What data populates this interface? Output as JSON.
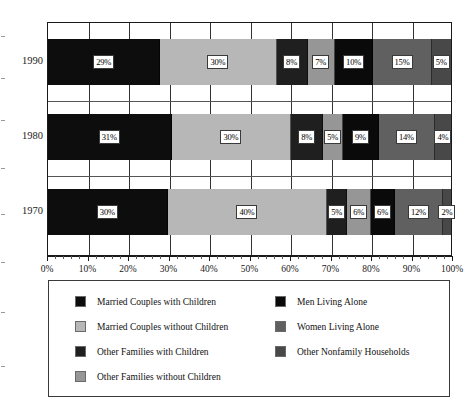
{
  "chart_data": {
    "type": "bar",
    "subtype": "stacked-horizontal-100pct",
    "title": "",
    "xlabel": "",
    "ylabel": "",
    "categories": [
      "1990",
      "1980",
      "1970"
    ],
    "xlim": [
      0,
      100
    ],
    "x_tick_labels": [
      "0%",
      "10%",
      "20%",
      "30%",
      "40%",
      "50%",
      "60%",
      "70%",
      "80%",
      "90%",
      "100%"
    ],
    "x_tick_values": [
      0,
      10,
      20,
      30,
      40,
      50,
      60,
      70,
      80,
      90,
      100
    ],
    "x_minor_tick_step": 2,
    "grid": true,
    "legend_position": "bottom",
    "series": [
      {
        "name": "Married Couples with Children",
        "color": "#0d0d0d",
        "values": [
          29,
          31,
          30
        ],
        "labels": [
          "29%",
          "31%",
          "30%"
        ]
      },
      {
        "name": "Married Couples without Children",
        "color": "#b7b7b7",
        "values": [
          30,
          30,
          40
        ],
        "labels": [
          "30%",
          "30%",
          "40%"
        ]
      },
      {
        "name": "Other Families with Children",
        "color": "#1f1f1f",
        "values": [
          8,
          8,
          5
        ],
        "labels": [
          "8%",
          "8%",
          "5%"
        ]
      },
      {
        "name": "Other Families without Children",
        "color": "#969696",
        "values": [
          7,
          5,
          6
        ],
        "labels": [
          "7%",
          "5%",
          "6%"
        ]
      },
      {
        "name": "Men Living Alone",
        "color": "#0a0a0a",
        "values": [
          10,
          9,
          6
        ],
        "labels": [
          "10%",
          "9%",
          "6%"
        ]
      },
      {
        "name": "Women Living Alone",
        "color": "#606060",
        "values": [
          15,
          14,
          12
        ],
        "labels": [
          "15%",
          "14%",
          "12%"
        ]
      },
      {
        "name": "Other Nonfamily Households",
        "color": "#484848",
        "values": [
          5,
          4,
          2
        ],
        "labels": [
          "5%",
          "4%",
          "2%"
        ]
      }
    ]
  },
  "legend": {
    "columns": [
      [
        {
          "label": "Married Couples with Children",
          "color": "#0d0d0d"
        },
        {
          "label": "Married Couples without Children",
          "color": "#b7b7b7"
        },
        {
          "label": "Other Families with Children",
          "color": "#1f1f1f"
        },
        {
          "label": "Other Families without Children",
          "color": "#969696"
        }
      ],
      [
        {
          "label": "Men Living Alone",
          "color": "#0a0a0a"
        },
        {
          "label": "Women Living Alone",
          "color": "#606060"
        },
        {
          "label": "Other Nonfamily Households",
          "color": "#484848"
        }
      ]
    ]
  }
}
